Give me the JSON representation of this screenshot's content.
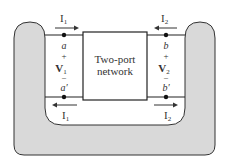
{
  "diagram": {
    "type": "two-port network",
    "box_label_line1": "Two-port",
    "box_label_line2": "network",
    "port1": {
      "current_top": "I",
      "current_top_sub": "1",
      "current_bottom": "I",
      "current_bottom_sub": "1",
      "terminal_top": "a",
      "terminal_bottom": "a′",
      "voltage": "V",
      "voltage_sub": "1",
      "plus": "+",
      "minus": "–"
    },
    "port2": {
      "current_top": "I",
      "current_top_sub": "2",
      "current_bottom": "I",
      "current_bottom_sub": "2",
      "terminal_top": "b",
      "terminal_bottom": "b′",
      "voltage": "V",
      "voltage_sub": "2",
      "plus": "+",
      "minus": "–"
    },
    "colors": {
      "enclosure_fill": "#d9d9d9",
      "stroke": "#333333",
      "background": "#ffffff"
    }
  }
}
